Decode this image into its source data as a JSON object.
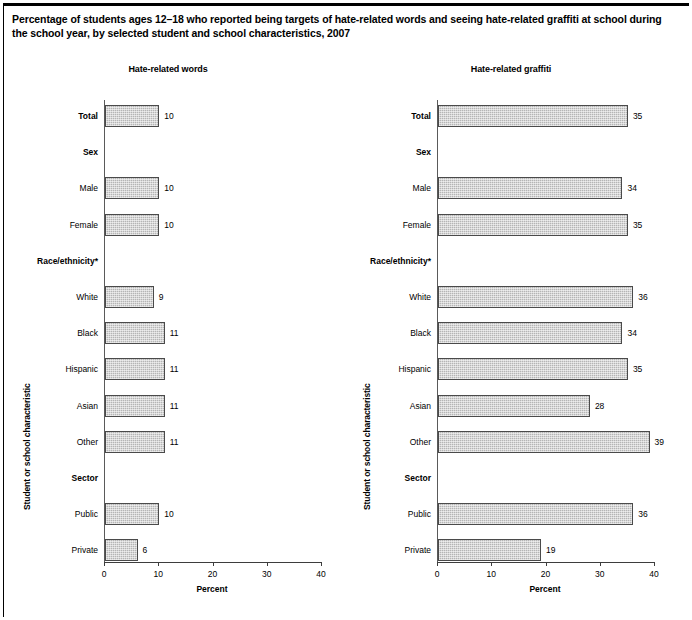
{
  "title": "Percentage of students ages 12–18 who reported being targets of hate-related words and seeing hate-related graffiti at school during the school year, by selected student and school characteristics, 2007",
  "chart_data": {
    "type": "bar",
    "orientation": "horizontal",
    "title": "Percentage of students ages 12–18 who reported being targets of hate-related words and seeing hate-related graffiti at school during the school year, by selected student and school characteristics, 2007",
    "xlabel": "Percent",
    "ylabel": "Student or school characteristic",
    "xlim": [
      0,
      40
    ],
    "xticks": [
      0,
      10,
      20,
      30,
      40
    ],
    "xtick_labels": [
      "0",
      "10",
      "20",
      "30",
      "40"
    ],
    "grid": false,
    "legend": "none",
    "categories": [
      "Total",
      "Sex",
      "Male",
      "Female",
      "Race/ethnicity*",
      "White",
      "Black",
      "Hispanic",
      "Asian",
      "Other",
      "Sector",
      "Public",
      "Private"
    ],
    "header_categories": [
      "Sex",
      "Race/ethnicity*",
      "Sector"
    ],
    "panels": [
      {
        "title": "Hate-related words",
        "xlabel": "Percent",
        "ylabel": "Student or school characteristic",
        "rows": [
          {
            "label": "Total",
            "header": true,
            "value": 10,
            "value_label": "10"
          },
          {
            "label": "Sex",
            "header": true,
            "value": null,
            "value_label": ""
          },
          {
            "label": "Male",
            "header": false,
            "value": 10,
            "value_label": "10"
          },
          {
            "label": "Female",
            "header": false,
            "value": 10,
            "value_label": "10"
          },
          {
            "label": "Race/ethnicity*",
            "header": true,
            "value": null,
            "value_label": ""
          },
          {
            "label": "White",
            "header": false,
            "value": 9,
            "value_label": "9"
          },
          {
            "label": "Black",
            "header": false,
            "value": 11,
            "value_label": "11"
          },
          {
            "label": "Hispanic",
            "header": false,
            "value": 11,
            "value_label": "11"
          },
          {
            "label": "Asian",
            "header": false,
            "value": 11,
            "value_label": "11"
          },
          {
            "label": "Other",
            "header": false,
            "value": 11,
            "value_label": "11"
          },
          {
            "label": "Sector",
            "header": true,
            "value": null,
            "value_label": ""
          },
          {
            "label": "Public",
            "header": false,
            "value": 10,
            "value_label": "10"
          },
          {
            "label": "Private",
            "header": false,
            "value": 6,
            "value_label": "6"
          }
        ]
      },
      {
        "title": "Hate-related graffiti",
        "xlabel": "Percent",
        "ylabel": "Student or school characteristic",
        "rows": [
          {
            "label": "Total",
            "header": true,
            "value": 35,
            "value_label": "35"
          },
          {
            "label": "Sex",
            "header": true,
            "value": null,
            "value_label": ""
          },
          {
            "label": "Male",
            "header": false,
            "value": 34,
            "value_label": "34"
          },
          {
            "label": "Female",
            "header": false,
            "value": 35,
            "value_label": "35"
          },
          {
            "label": "Race/ethnicity*",
            "header": true,
            "value": null,
            "value_label": ""
          },
          {
            "label": "White",
            "header": false,
            "value": 36,
            "value_label": "36"
          },
          {
            "label": "Black",
            "header": false,
            "value": 34,
            "value_label": "34"
          },
          {
            "label": "Hispanic",
            "header": false,
            "value": 35,
            "value_label": "35"
          },
          {
            "label": "Asian",
            "header": false,
            "value": 28,
            "value_label": "28"
          },
          {
            "label": "Other",
            "header": false,
            "value": 39,
            "value_label": "39"
          },
          {
            "label": "Sector",
            "header": true,
            "value": null,
            "value_label": ""
          },
          {
            "label": "Public",
            "header": false,
            "value": 36,
            "value_label": "36"
          },
          {
            "label": "Private",
            "header": false,
            "value": 19,
            "value_label": "19"
          }
        ]
      }
    ]
  },
  "style": {
    "bar_fill": "#b5b5b5",
    "bar_border": "#4a4a4a",
    "axis_color": "#3d3d3d",
    "text_color": "#000000"
  }
}
